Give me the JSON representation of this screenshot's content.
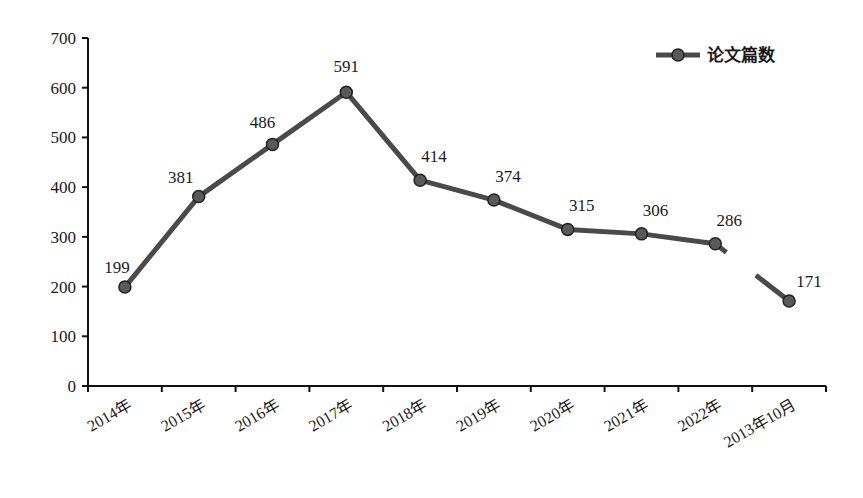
{
  "chart_data": {
    "type": "line",
    "title": "",
    "xlabel": "",
    "ylabel": "",
    "categories": [
      "2014年",
      "2015年",
      "2016年",
      "2017年",
      "2018年",
      "2019年",
      "2020年",
      "2021年",
      "2022年",
      "2013年10月"
    ],
    "series": [
      {
        "name": "论文篇数",
        "values": [
          199,
          381,
          486,
          591,
          414,
          374,
          315,
          306,
          286,
          171
        ],
        "color": "#4a4a4a",
        "marker_color": "#5a5a5a",
        "break_before_last": true
      }
    ],
    "ylim": [
      0,
      700
    ],
    "yticks": [
      0,
      100,
      200,
      300,
      400,
      500,
      600,
      700
    ],
    "grid": false,
    "legend": {
      "position": "top-right"
    },
    "data_labels": [
      "199",
      "381",
      "486",
      "591",
      "414",
      "374",
      "315",
      "306",
      "286",
      "171"
    ]
  }
}
